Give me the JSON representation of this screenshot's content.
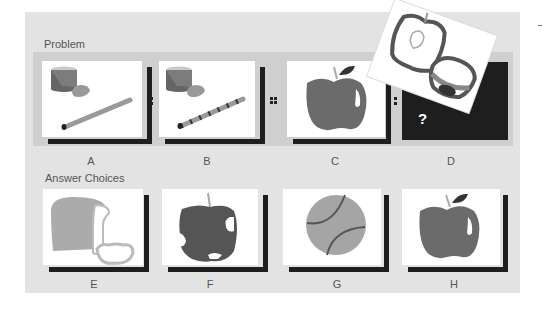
{
  "problem": {
    "title": "Problem",
    "frames": [
      {
        "letter": "A",
        "content": "can-clay-straw-plain"
      },
      {
        "letter": "B",
        "content": "can-clay-straw-striped"
      },
      {
        "letter": "C",
        "content": "whole-apple"
      },
      {
        "letter": "D",
        "content": "unknown",
        "placeholder": "?",
        "overlay": "sliced-apple"
      }
    ],
    "separators": [
      ":",
      "::",
      ":"
    ]
  },
  "answers": {
    "title": "Answer Choices",
    "choices": [
      {
        "letter": "E",
        "content": "sliced-bread"
      },
      {
        "letter": "F",
        "content": "bitten-apple"
      },
      {
        "letter": "G",
        "content": "tennis-ball"
      },
      {
        "letter": "H",
        "content": "whole-apple"
      }
    ]
  },
  "colors": {
    "background": "#e3e3e3",
    "band": "#cfcfcf",
    "shadow": "#1e1e1e",
    "object_dark": "#5a5a5a",
    "object_mid": "#8c8c8c",
    "object_light": "#a8a8a8"
  }
}
